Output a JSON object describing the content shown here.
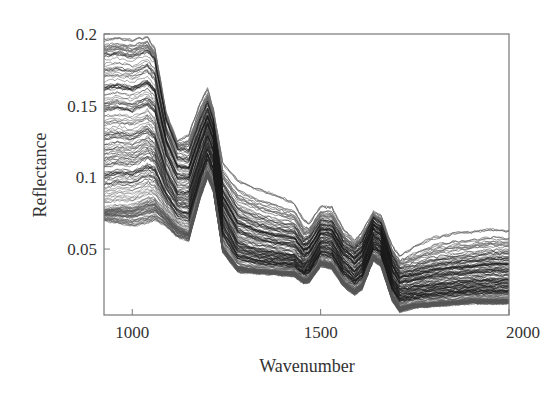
{
  "chart_data": {
    "type": "line",
    "title": "",
    "xlabel": "Wavenumber",
    "ylabel": "Reflectance",
    "xlim": [
      925,
      2000
    ],
    "ylim": [
      0.004,
      0.2
    ],
    "grid": false,
    "legend": null,
    "x_ticks": [
      1000,
      1500,
      2000
    ],
    "x_tick_labels": [
      "1000",
      "1500",
      "2000"
    ],
    "y_ticks": [
      0.05,
      0.1,
      0.15,
      0.2
    ],
    "y_tick_labels": [
      "0.05",
      "0.1",
      "0.15",
      "0.2"
    ],
    "line_color": "#1a1a1a",
    "n_spectra_approx": 200,
    "x": [
      925,
      960,
      1000,
      1040,
      1060,
      1090,
      1120,
      1150,
      1180,
      1200,
      1215,
      1240,
      1280,
      1330,
      1380,
      1430,
      1455,
      1470,
      1500,
      1530,
      1560,
      1590,
      1610,
      1640,
      1660,
      1690,
      1710,
      1750,
      1800,
      1850,
      1900,
      1950,
      2000
    ],
    "series": [
      {
        "name": "upper envelope",
        "values": [
          0.196,
          0.197,
          0.196,
          0.198,
          0.19,
          0.145,
          0.125,
          0.13,
          0.152,
          0.162,
          0.148,
          0.11,
          0.098,
          0.092,
          0.088,
          0.082,
          0.07,
          0.068,
          0.08,
          0.079,
          0.064,
          0.056,
          0.062,
          0.076,
          0.073,
          0.052,
          0.045,
          0.052,
          0.058,
          0.061,
          0.062,
          0.064,
          0.063
        ]
      },
      {
        "name": "upper dense band",
        "values": [
          0.185,
          0.186,
          0.184,
          0.188,
          0.182,
          0.14,
          0.12,
          0.118,
          0.14,
          0.152,
          0.14,
          0.095,
          0.078,
          0.072,
          0.068,
          0.066,
          0.056,
          0.058,
          0.07,
          0.069,
          0.056,
          0.05,
          0.055,
          0.072,
          0.068,
          0.045,
          0.036,
          0.038,
          0.042,
          0.044,
          0.045,
          0.047,
          0.047
        ]
      },
      {
        "name": "median",
        "values": [
          0.13,
          0.132,
          0.13,
          0.135,
          0.13,
          0.105,
          0.09,
          0.09,
          0.115,
          0.13,
          0.12,
          0.075,
          0.055,
          0.05,
          0.048,
          0.046,
          0.04,
          0.042,
          0.056,
          0.055,
          0.042,
          0.035,
          0.04,
          0.06,
          0.056,
          0.03,
          0.022,
          0.024,
          0.026,
          0.027,
          0.028,
          0.029,
          0.029
        ]
      },
      {
        "name": "lower dense band",
        "values": [
          0.078,
          0.08,
          0.08,
          0.085,
          0.085,
          0.075,
          0.066,
          0.062,
          0.09,
          0.105,
          0.095,
          0.052,
          0.038,
          0.036,
          0.035,
          0.034,
          0.029,
          0.03,
          0.042,
          0.04,
          0.028,
          0.022,
          0.026,
          0.046,
          0.042,
          0.018,
          0.01,
          0.012,
          0.013,
          0.014,
          0.015,
          0.015,
          0.015
        ]
      },
      {
        "name": "lower envelope",
        "values": [
          0.07,
          0.068,
          0.066,
          0.068,
          0.07,
          0.066,
          0.058,
          0.056,
          0.085,
          0.1,
          0.09,
          0.048,
          0.034,
          0.033,
          0.032,
          0.031,
          0.026,
          0.027,
          0.038,
          0.036,
          0.024,
          0.018,
          0.022,
          0.042,
          0.038,
          0.014,
          0.006,
          0.009,
          0.01,
          0.011,
          0.012,
          0.012,
          0.012
        ]
      }
    ]
  }
}
